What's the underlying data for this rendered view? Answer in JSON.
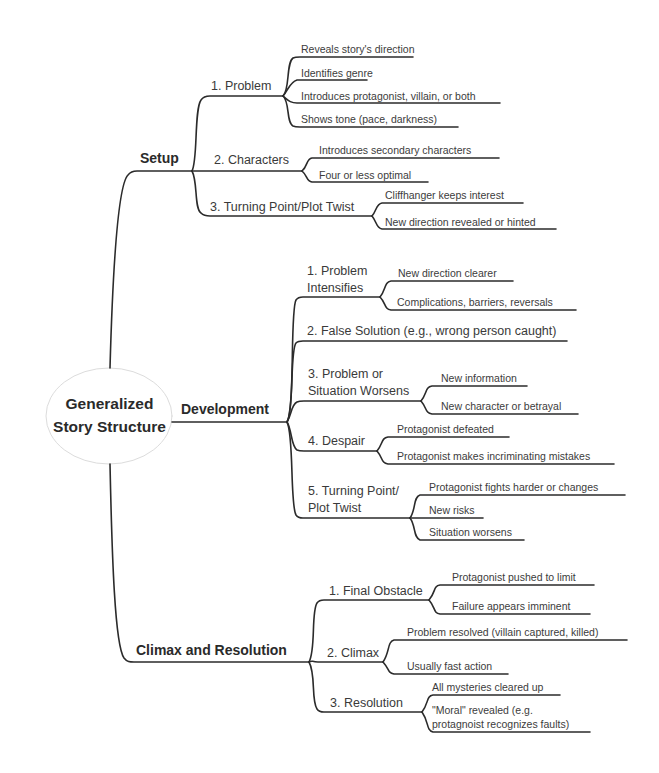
{
  "root": {
    "line1": "Generalized",
    "line2": "Story Structure"
  },
  "branches": [
    {
      "label": "Setup",
      "children": [
        {
          "label": "1. Problem",
          "leaves": [
            "Reveals story's direction",
            "Identifies genre",
            "Introduces protagonist, villain, or both",
            "Shows tone (pace, darkness)"
          ]
        },
        {
          "label": "2. Characters",
          "leaves": [
            "Introduces secondary characters",
            "Four or less optimal"
          ]
        },
        {
          "label": "3. Turning Point/Plot Twist",
          "leaves": [
            "Cliffhanger keeps interest",
            "New direction revealed or hinted"
          ]
        }
      ]
    },
    {
      "label": "Development",
      "children": [
        {
          "label_line1": "1. Problem",
          "label_line2": "Intensifies",
          "leaves": [
            "New direction clearer",
            "Complications, barriers, reversals"
          ]
        },
        {
          "label": "2. False Solution (e.g., wrong person caught)",
          "leaves": []
        },
        {
          "label_line1": "3. Problem or",
          "label_line2": "Situation Worsens",
          "leaves": [
            "New information",
            "New character or betrayal"
          ]
        },
        {
          "label": "4. Despair",
          "leaves": [
            "Protagonist defeated",
            "Protagonist makes incriminating mistakes"
          ]
        },
        {
          "label_line1": "5. Turning Point/",
          "label_line2": "Plot Twist",
          "leaves": [
            "Protagonist fights harder or changes",
            "New risks",
            "Situation worsens"
          ]
        }
      ]
    },
    {
      "label": "Climax and Resolution",
      "children": [
        {
          "label": "1. Final Obstacle",
          "leaves": [
            "Protagonist pushed to limit",
            "Failure appears imminent"
          ]
        },
        {
          "label": "2. Climax",
          "leaves": [
            "Problem resolved (villain captured, killed)",
            "Usually fast action"
          ]
        },
        {
          "label": "3. Resolution",
          "leaves": [
            "All mysteries cleared up",
            "\"Moral\" revealed (e.g.",
            "protagnoist recognizes faults)"
          ]
        }
      ]
    }
  ],
  "colors": {
    "line": "#2b2b2b",
    "text": "#3a3a3a",
    "oval_border": "#dcdcdc"
  }
}
